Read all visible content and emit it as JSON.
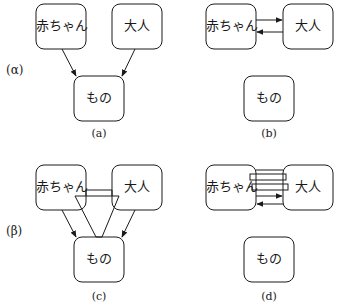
{
  "diagram": {
    "rows": [
      {
        "label": "(α)"
      },
      {
        "label": "(β)"
      }
    ],
    "panels": [
      {
        "caption": "(a)",
        "baby": "赤ちゃん",
        "adult": "大人",
        "object": "もの"
      },
      {
        "caption": "(b)",
        "baby": "赤ちゃん",
        "adult": "大人",
        "object": "もの"
      },
      {
        "caption": "(c)",
        "baby": "赤ちゃん",
        "adult": "大人",
        "object": "もの"
      },
      {
        "caption": "(d)",
        "baby": "赤ちゃん",
        "adult": "大人",
        "object": "もの"
      }
    ],
    "colors": {
      "stroke": "#1a1a1a",
      "background": "#ffffff"
    }
  }
}
